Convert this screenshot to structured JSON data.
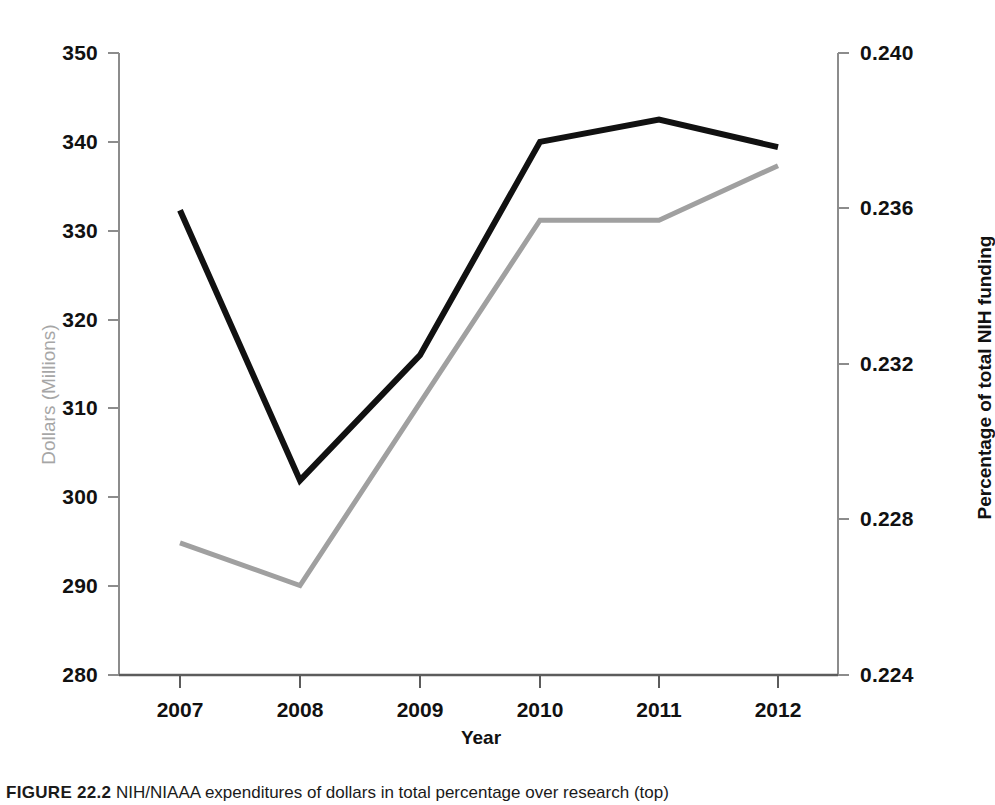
{
  "chart_data": {
    "type": "line",
    "title": "",
    "subtitle": "",
    "xlabel": "Year",
    "categories": [
      "2007",
      "2008",
      "2009",
      "2010",
      "2011",
      "2012"
    ],
    "x": [
      2007,
      2008,
      2009,
      2010,
      2011,
      2012
    ],
    "grid": false,
    "legend": "none",
    "axes": {
      "left": {
        "label": "Dollars (Millions)",
        "color": "#a6a6a6",
        "ticks": [
          "280",
          "290",
          "300",
          "310",
          "320",
          "330",
          "340",
          "350"
        ],
        "tick_values": [
          280,
          290,
          300,
          310,
          320,
          330,
          340,
          350
        ],
        "ylim": [
          280,
          350
        ]
      },
      "right": {
        "label": "Percentage  of  total NIH funding",
        "color": "#111111",
        "ticks": [
          "0.224",
          "0.228",
          "0.232",
          "0.236",
          "0.240"
        ],
        "tick_values": [
          0.224,
          0.228,
          0.232,
          0.236,
          0.24
        ],
        "ylim": [
          0.224,
          0.24
        ]
      }
    },
    "series": [
      {
        "name": "Dollars (Millions)",
        "axis": "right",
        "color": "#111111",
        "line_width": 6,
        "values": [
          332.3,
          301.9,
          316.0,
          340.0,
          342.5,
          339.4
        ]
      },
      {
        "name": "Percentage of total NIH funding",
        "axis": "left",
        "color": "#a0a0a0",
        "line_width": 5,
        "values": [
          0.2274,
          0.2263,
          0.231,
          0.2357,
          0.2357,
          0.2371
        ]
      }
    ]
  },
  "caption": {
    "label": "FIGURE 22.2",
    "text": "NIH/NIAAA expenditures of dollars in total percentage over research (top)"
  }
}
